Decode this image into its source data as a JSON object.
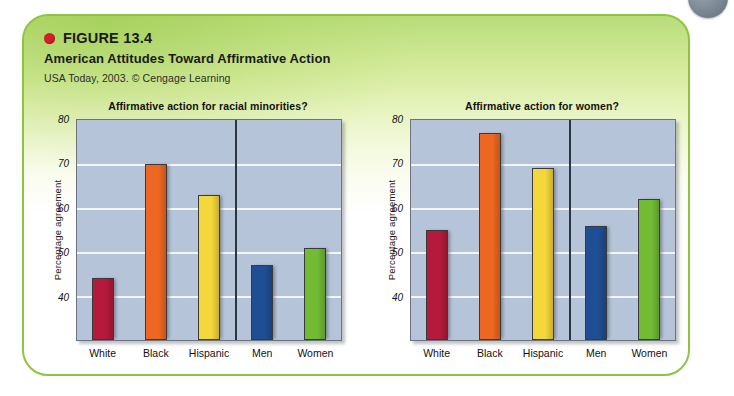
{
  "figure": {
    "label": "FIGURE 13.4",
    "title": "American Attitudes Toward Affirmative Action",
    "source": "USA Today, 2003. © Cengage Learning",
    "bullet_color": "#d0202a",
    "panel_border_color": "#8cc63e"
  },
  "chart_data": [
    {
      "type": "bar",
      "title": "Affirmative action for racial minorities?",
      "xlabel": "",
      "ylabel": "Percentage agreement",
      "ylim": [
        30,
        80
      ],
      "yticks": [
        80,
        70,
        60,
        50,
        40
      ],
      "grid": true,
      "legend": "none",
      "categories": [
        "White",
        "Black",
        "Hispanic",
        "Men",
        "Women"
      ],
      "values": [
        44,
        70,
        63,
        47,
        51
      ],
      "colors": [
        "#b51a3c",
        "#ee6722",
        "#f4d73a",
        "#1f4e95",
        "#72bb34"
      ],
      "group_divider_after": "Hispanic"
    },
    {
      "type": "bar",
      "title": "Affirmative action for women?",
      "xlabel": "",
      "ylabel": "Percentage agreement",
      "ylim": [
        30,
        80
      ],
      "yticks": [
        80,
        70,
        60,
        50,
        40
      ],
      "grid": true,
      "legend": "none",
      "categories": [
        "White",
        "Black",
        "Hispanic",
        "Men",
        "Women"
      ],
      "values": [
        55,
        77,
        69,
        56,
        62
      ],
      "colors": [
        "#b51a3c",
        "#ee6722",
        "#f4d73a",
        "#1f4e95",
        "#72bb34"
      ],
      "group_divider_after": "Hispanic"
    }
  ]
}
